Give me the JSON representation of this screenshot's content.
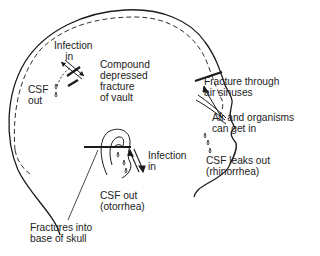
{
  "labels": {
    "infection_in_top": "Infection\n    in",
    "compound_fracture": "Compound\ndepressed\nfracture\nof vault",
    "csf_out_top": "CSF\nout",
    "fracture_air_sinuses": "Fracture through\nair sinuses",
    "air_organisms": "Air and organisms\ncan get in",
    "csf_leaks_out": "CSF leaks out\n(rhinorrhea)",
    "infection_in_ear": "Infection\nin",
    "csf_out_ear": "CSF out\n(otorrhea)",
    "fractures_base": "Fractures into\nbase of skull"
  },
  "colors": {
    "line": "#1a1a1a",
    "background": "#ffffff"
  }
}
